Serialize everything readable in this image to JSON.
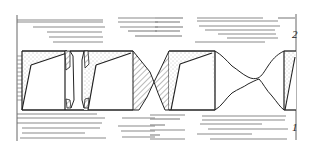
{
  "diagram": {
    "title": "",
    "labels": {
      "top_plate": "2",
      "bottom_plate": "1"
    },
    "colors": {
      "line": "#222222",
      "hatch_lines": "#9a9a9a",
      "stipple": "#bdbdbd",
      "background": "#ffffff"
    },
    "elements": [
      {
        "id": "top-plate",
        "type": "layered-plate",
        "label": "2"
      },
      {
        "id": "bottom-plate",
        "type": "layered-plate",
        "label": "1"
      },
      {
        "id": "block-1",
        "type": "trapezoid-block",
        "fill": "stipple"
      },
      {
        "id": "block-2",
        "type": "trapezoid-block",
        "fill": "stipple"
      },
      {
        "id": "block-3",
        "type": "trapezoid-block",
        "fill": "stipple+hatch"
      },
      {
        "id": "block-4",
        "type": "trapezoid-block",
        "fill": "stipple"
      },
      {
        "id": "neck-joint-1",
        "type": "hatched-neck"
      },
      {
        "id": "neck-joint-2",
        "type": "wavy-neck"
      }
    ]
  }
}
